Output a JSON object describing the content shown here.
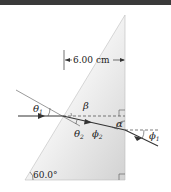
{
  "diagram": {
    "type": "prism-refraction",
    "dimension_label": "6.00 cm",
    "apex_angle_label": "60.0°",
    "angle_labels": {
      "theta1": {
        "symbol": "θ",
        "sub": "1"
      },
      "theta2": {
        "symbol": "θ",
        "sub": "2"
      },
      "beta": {
        "symbol": "β"
      },
      "alpha": {
        "symbol": "α"
      },
      "phi2": {
        "symbol": "ϕ",
        "sub": "2"
      },
      "phi1": {
        "symbol": "ϕ",
        "sub": "1"
      }
    },
    "colors": {
      "prism_fill": "#d8d8d8",
      "ray": "#333333",
      "topbar": "#3a3a3a"
    }
  }
}
